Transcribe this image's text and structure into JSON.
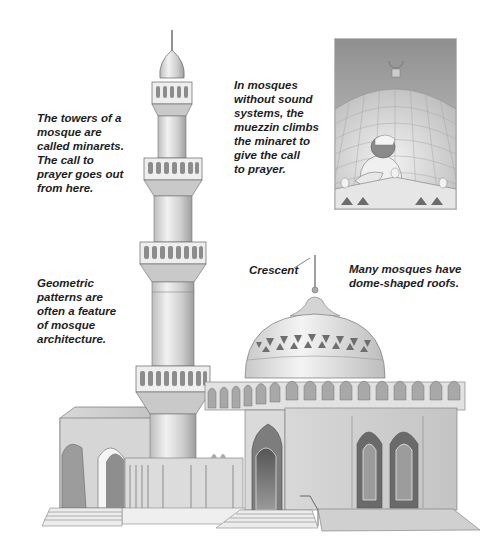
{
  "illustration": {
    "subject": "mosque",
    "captions": {
      "minarets": [
        "The towers of a",
        "mosque are",
        "called minarets.",
        "The call to",
        "prayer goes out",
        "from here."
      ],
      "muezzin": [
        "In mosques",
        "without sound",
        "systems, the",
        "muezzin climbs",
        "the minaret to",
        "give the call",
        "to prayer."
      ],
      "geometric": [
        "Geometric",
        "patterns are",
        "often a feature",
        "of mosque",
        "architecture."
      ],
      "crescent": "Crescent",
      "domes": [
        "Many mosques have",
        "dome-shaped roofs."
      ]
    },
    "inset": {
      "depicts": "muezzin calling to prayer in front of a dome topped with a crescent"
    },
    "colors": {
      "background": "#ffffff",
      "text": "#1d1d1d",
      "stone_light": "#e6e6e6",
      "stone_mid": "#c8c8c8",
      "stone_dark": "#8a8a8a",
      "sky_inset": "#9a9a9a"
    }
  }
}
